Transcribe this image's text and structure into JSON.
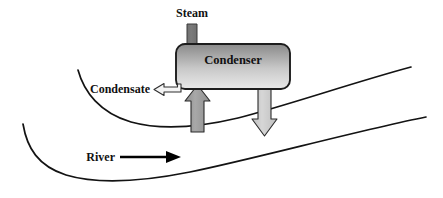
{
  "diagram": {
    "canvas": {
      "width": 443,
      "height": 198,
      "background": "#ffffff"
    },
    "labels": {
      "steam": "Steam",
      "condenser": "Condenser",
      "condensate": "Condensate",
      "river": "River"
    },
    "colors": {
      "outline": "#131313",
      "text": "#111111",
      "steam_arrow": "#6e6e6e",
      "cooling_in_arrow": "#9a9a9a",
      "cooling_out_arrow": "#c4c4c4",
      "condensate_arrow_fill": "#f2f2f2",
      "condenser_gradient_top": "#8e8e8e",
      "condenser_gradient_bottom": "#e8e8e8",
      "river_arrow": "#000000"
    },
    "elements": [
      {
        "name": "steam-inlet-arrow",
        "direction": "down",
        "fill": "#6e6e6e"
      },
      {
        "name": "condenser-vessel",
        "shape": "rounded-rectangle"
      },
      {
        "name": "condensate-outlet-arrow",
        "direction": "left",
        "fill": "#f2f2f2"
      },
      {
        "name": "cooling-water-inlet-arrow",
        "direction": "up",
        "fill": "#9a9a9a"
      },
      {
        "name": "cooling-water-outlet-arrow",
        "direction": "down",
        "fill": "#c4c4c4"
      },
      {
        "name": "river-flow-arrow",
        "direction": "right",
        "fill": "#000000"
      },
      {
        "name": "river-bank-upper",
        "shape": "curve"
      },
      {
        "name": "river-bank-lower",
        "shape": "curve"
      }
    ]
  }
}
